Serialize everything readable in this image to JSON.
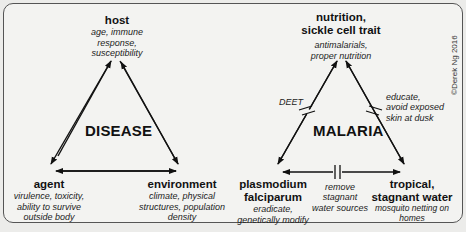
{
  "disease": {
    "center_label": "DISEASE",
    "host": {
      "title": "host",
      "detail_lines": [
        "age, immune",
        "response,",
        "susceptibility"
      ]
    },
    "agent": {
      "title": "agent",
      "detail_lines": [
        "virulence, toxicity,",
        "ability to survive",
        "outside body"
      ]
    },
    "environment": {
      "title": "environment",
      "detail_lines": [
        "climate, physical",
        "structures, population",
        "density"
      ]
    }
  },
  "malaria": {
    "center_label": "MALARIA",
    "host": {
      "title_lines": [
        "nutrition,",
        "sickle cell trait"
      ],
      "detail_lines": [
        "antimalarials,",
        "proper nutrition"
      ]
    },
    "agent": {
      "title_lines": [
        "plasmodium",
        "falciparum"
      ],
      "detail_lines": [
        "eradicate,",
        "genetically modify"
      ]
    },
    "environment": {
      "title_lines": [
        "tropical,",
        "stagnant water"
      ],
      "detail_lines": [
        "mosquito netting on homes"
      ]
    },
    "interventions": {
      "host_agent": "DEET",
      "host_environment_lines": [
        "educate,",
        "avoid exposed",
        "skin at dusk"
      ],
      "agent_environment_lines": [
        "remove stagnant",
        "water sources"
      ]
    }
  },
  "copyright": "©Derek Ng 2016"
}
